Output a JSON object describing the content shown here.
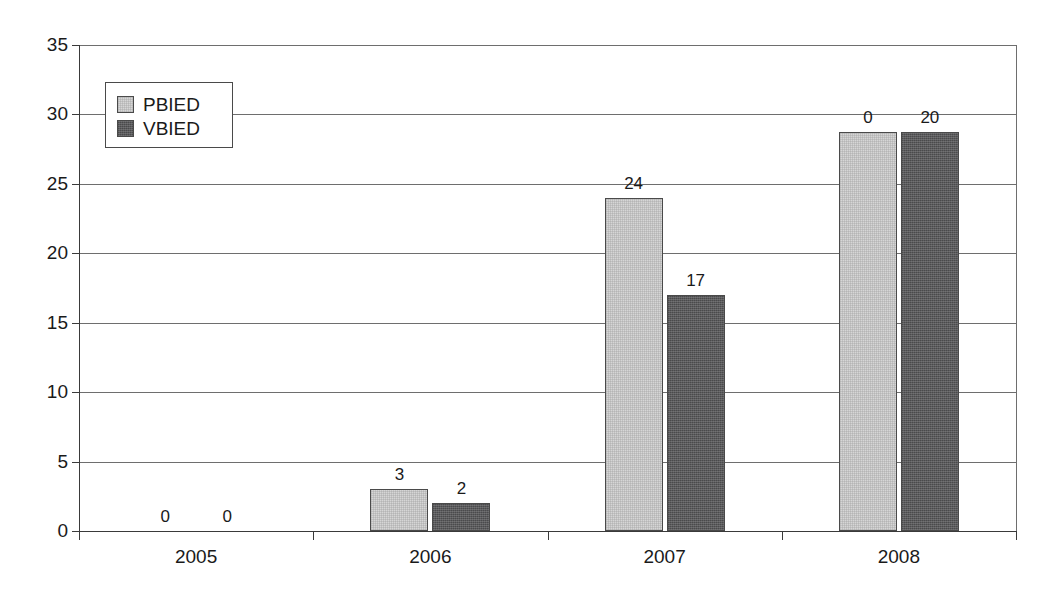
{
  "chart_data": {
    "type": "bar",
    "title": "",
    "subtitle": "",
    "xlabel": "",
    "ylabel": "",
    "categories": [
      "2005",
      "2006",
      "2007",
      "2008"
    ],
    "series": [
      {
        "name": "PBIED",
        "color": "#d6d6d6",
        "values": [
          0,
          3,
          24,
          28.7
        ],
        "labels": [
          "0",
          "3",
          "24",
          "0"
        ]
      },
      {
        "name": "VBIED",
        "color": "#5a5a5c",
        "values": [
          0,
          2,
          17,
          28.7
        ],
        "labels": [
          "0",
          "2",
          "17",
          "20"
        ]
      }
    ],
    "ylim": [
      0,
      35
    ],
    "yticks": [
      0,
      5,
      10,
      15,
      20,
      25,
      30,
      35
    ],
    "ytick_labels": [
      "0",
      "5",
      "10",
      "15",
      "20",
      "25",
      "30",
      "35"
    ],
    "grid": true,
    "legend_position": "upper-left-inside",
    "legend_entries": [
      "PBIED",
      "VBIED"
    ]
  }
}
